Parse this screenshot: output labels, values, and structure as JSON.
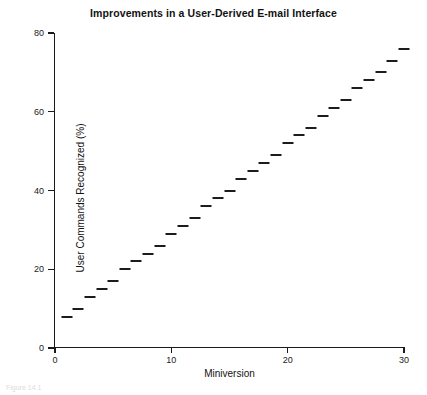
{
  "chart_data": {
    "type": "scatter",
    "title": "Improvements in a User-Derived E-mail Interface",
    "xlabel": "Miniversion",
    "ylabel": "User Commands Recognized (%)",
    "xlim": [
      0,
      30
    ],
    "ylim": [
      0,
      80
    ],
    "xticks": [
      0,
      10,
      20,
      30
    ],
    "yticks": [
      0,
      20,
      40,
      60,
      80
    ],
    "grid": false,
    "legend": null,
    "marker": "horizontal-dash",
    "series_name": "User commands recognized",
    "x": [
      1,
      2,
      3,
      4,
      5,
      6,
      7,
      8,
      9,
      10,
      11,
      12,
      13,
      14,
      15,
      16,
      17,
      18,
      19,
      20,
      21,
      22,
      23,
      24,
      25,
      26,
      27,
      28,
      29,
      30
    ],
    "values": [
      8,
      10,
      13,
      15,
      17,
      20,
      22,
      24,
      26,
      29,
      31,
      33,
      36,
      38,
      40,
      43,
      45,
      47,
      49,
      52,
      54,
      56,
      59,
      61,
      63,
      66,
      68,
      70,
      73,
      76
    ]
  },
  "caption": "Figure 14.1"
}
